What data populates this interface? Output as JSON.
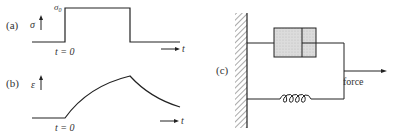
{
  "panels": {
    "a": {
      "label": "(a)",
      "y_symbol": "σ",
      "level_label": "σ",
      "level_sub": "0",
      "start_label": "t = 0",
      "x_symbol": "t"
    },
    "b": {
      "label": "(b)",
      "y_symbol": "ε",
      "start_label": "t = 0",
      "x_symbol": "t"
    },
    "c": {
      "label": "(c)",
      "force_label": "force",
      "components": [
        "fixed-wall",
        "dashpot",
        "spring"
      ]
    }
  },
  "colors": {
    "line": "#222222",
    "dashpot_fill": "#d9d9d9",
    "text": "#333333"
  }
}
